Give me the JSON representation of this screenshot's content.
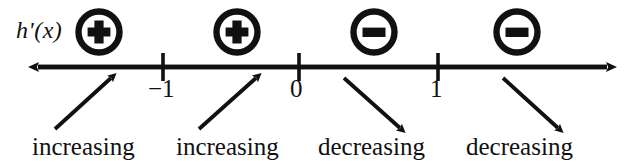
{
  "figure": {
    "type": "sign-chart-number-line",
    "function_label": "h'(x)",
    "axis": {
      "left_arrow": "arrow-left",
      "right_arrow": "arrow-right",
      "tick_labels": [
        "−1",
        "0",
        "1"
      ]
    },
    "signs": [
      {
        "symbol": "⊕",
        "name": "plus",
        "interval": "x < −1"
      },
      {
        "symbol": "⊕",
        "name": "plus",
        "interval": "−1 < x < 0"
      },
      {
        "symbol": "⊖",
        "name": "minus",
        "interval": "0 < x < 1"
      },
      {
        "symbol": "⊖",
        "name": "minus",
        "interval": "x > 1"
      }
    ],
    "behavior_labels": [
      "increasing",
      "increasing",
      "decreasing",
      "decreasing"
    ],
    "colors": {
      "ink": "#111111",
      "background": "#ffffff"
    }
  }
}
